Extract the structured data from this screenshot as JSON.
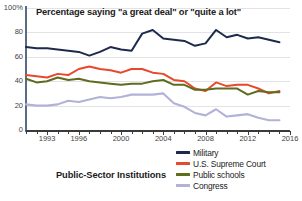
{
  "chart_data": {
    "type": "line",
    "title": "Percentage saying \"a great deal\" or \"quite a lot\"",
    "caption": "Public-Sector Institutions",
    "xlabel": "",
    "ylabel": "",
    "ylim": [
      0,
      100
    ],
    "xlim": [
      1991,
      2016
    ],
    "grid": true,
    "legend_position": "bottom-right",
    "y_ticks": [
      "0",
      "20",
      "40",
      "60",
      "80",
      "100%"
    ],
    "y_tick_values": [
      0,
      20,
      40,
      60,
      80,
      100
    ],
    "x_ticks": [
      "1993",
      "1996",
      "2000",
      "2004",
      "2008",
      "2012",
      "2016"
    ],
    "x_tick_values": [
      1993,
      1996,
      2000,
      2004,
      2008,
      2012,
      2016
    ],
    "x": [
      1991,
      1992,
      1993,
      1994,
      1995,
      1996,
      1997,
      1998,
      1999,
      2000,
      2001,
      2002,
      2003,
      2004,
      2005,
      2006,
      2007,
      2008,
      2009,
      2010,
      2011,
      2012,
      2013,
      2014,
      2015
    ],
    "series": [
      {
        "name": "Military",
        "color": "#1d2a4d",
        "values": [
          68,
          67,
          67,
          66,
          65,
          64,
          61,
          64,
          68,
          66,
          65,
          79,
          82,
          75,
          74,
          73,
          69,
          71,
          82,
          76,
          78,
          75,
          76,
          74,
          72
        ]
      },
      {
        "name": "U.S. Supreme Court",
        "color": "#e8482b",
        "values": [
          45,
          44,
          43,
          46,
          45,
          50,
          52,
          50,
          49,
          47,
          50,
          50,
          47,
          46,
          41,
          40,
          34,
          32,
          39,
          36,
          37,
          37,
          34,
          30,
          32
        ]
      },
      {
        "name": "Public schools",
        "color": "#5f6b1f",
        "values": [
          42,
          39,
          40,
          43,
          41,
          42,
          40,
          39,
          38,
          37,
          38,
          38,
          40,
          41,
          37,
          37,
          33,
          33,
          34,
          34,
          34,
          29,
          32,
          31,
          31
        ]
      },
      {
        "name": "Congress",
        "color": "#b2b2d8",
        "values": [
          21,
          20,
          20,
          21,
          24,
          23,
          25,
          27,
          26,
          27,
          29,
          29,
          29,
          30,
          22,
          19,
          14,
          12,
          17,
          11,
          12,
          13,
          10,
          8,
          8
        ]
      }
    ]
  }
}
